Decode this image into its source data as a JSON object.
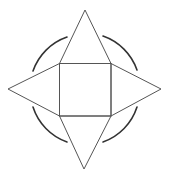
{
  "diagram": {
    "stroke_color": "#555555",
    "arc_color": "#333333",
    "background": "#ffffff",
    "center": [
      85,
      89
    ],
    "square": {
      "x": 59,
      "y": 63,
      "width": 52,
      "height": 53
    },
    "apexes": {
      "top": [
        85,
        10
      ],
      "left": [
        8,
        89
      ],
      "right": [
        161,
        89
      ],
      "bottom": [
        84,
        169
      ]
    },
    "arc_radius": 55,
    "arcs": [
      {
        "name": "top-left",
        "from": [
          33,
          71
        ],
        "to": [
          67,
          37
        ]
      },
      {
        "name": "top-right",
        "from": [
          103,
          36
        ],
        "to": [
          137,
          70
        ]
      },
      {
        "name": "bottom-right",
        "from": [
          137,
          107
        ],
        "to": [
          103,
          142
        ]
      },
      {
        "name": "bottom-left",
        "from": [
          67,
          142
        ],
        "to": [
          33,
          107
        ]
      }
    ]
  }
}
